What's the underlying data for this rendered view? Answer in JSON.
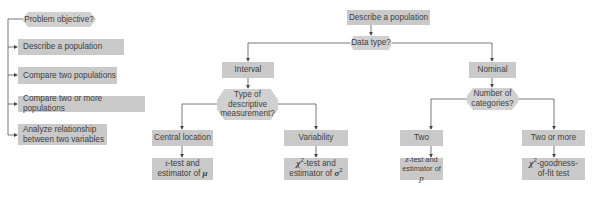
{
  "left_panel": {
    "question": "Problem objective?",
    "options": [
      {
        "label": "Describe a population"
      },
      {
        "label": "Compare two populations"
      },
      {
        "label": "Compare two or more populations"
      },
      {
        "label": "Analyze relationship between two variables"
      }
    ]
  },
  "tree": {
    "root": "Describe a population",
    "data_type_question": "Data type?",
    "interval": {
      "label": "Interval",
      "question": "Type of descriptive measurement?",
      "central_location": {
        "label": "Central location",
        "result_prefix_var": "t",
        "result_text_1": "-test and",
        "result_text_2": "estimator of ",
        "result_param": "μ"
      },
      "variability": {
        "label": "Variability",
        "result_prefix_var": "χ",
        "result_sup": "2",
        "result_text_1": "-test and",
        "result_text_2": "estimator of ",
        "result_param": "σ",
        "result_param_sup": "2"
      }
    },
    "nominal": {
      "label": "Nominal",
      "question": "Number of categories?",
      "two": {
        "label": "Two",
        "result_prefix_var": "z",
        "result_text_1": "-test and",
        "result_text_2": "estimator of ",
        "result_param": "p"
      },
      "two_or_more": {
        "label": "Two or more",
        "result_prefix_var": "χ",
        "result_sup": "2",
        "result_text_1": "-goodness-",
        "result_text_2": "of-fit test"
      }
    }
  },
  "colors": {
    "box_fill": "#c9c9c9",
    "hex_fill": "#d0d0d0",
    "line": "#555555",
    "text": "#3f3f3f"
  }
}
